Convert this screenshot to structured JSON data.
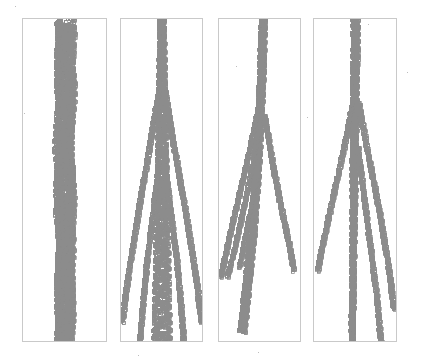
{
  "figure": {
    "type": "small-multiples",
    "panel_count": 4,
    "background_color": "#ffffff",
    "marker_color": "#8c8c8c",
    "marker_shape": "square-outline",
    "marker_size_px": 2.6,
    "panel_border_color": "#c9c9c9",
    "canvas_width": 427,
    "canvas_height": 362
  },
  "panels": [
    {
      "id": "panel-1",
      "label": "",
      "x": 22,
      "y": 18,
      "width": 85,
      "height": 324,
      "description": "single noisy vertical band, no branching"
    },
    {
      "id": "panel-2",
      "label": "",
      "x": 120,
      "y": 18,
      "width": 83,
      "height": 324,
      "description": "symmetric two-sided fan from central braid"
    },
    {
      "id": "panel-3",
      "label": "",
      "x": 218,
      "y": 18,
      "width": 83,
      "height": 324,
      "description": "asymmetric multi-branch fan, braid drifts left"
    },
    {
      "id": "panel-4",
      "label": "",
      "x": 313,
      "y": 18,
      "width": 84,
      "height": 324,
      "description": "branching with dominant rightward fan and straight central spine"
    }
  ],
  "chart_data": {
    "type": "scatter",
    "title": "",
    "subtitle": "",
    "xlabel": "",
    "ylabel": "",
    "grid": false,
    "legend": null,
    "axes_visible": false,
    "tick_labels_x": [],
    "tick_labels_y": [],
    "xlim": [
      0,
      1
    ],
    "ylim": [
      0,
      1
    ],
    "note": "Each panel plots marker trajectories in normalized panel coordinates; x in [0,1] left-to-right, y in [0,1] top-to-bottom. Branch entries give the polyline the markers follow plus the braid amplitude (half-width of the oscillating ribbon) at the start and end of each branch.",
    "panel_series": [
      {
        "panel": "panel-1",
        "branches": [
          {
            "name": "main-braid",
            "points": [
              [
                0.5,
                0.0
              ],
              [
                0.52,
                0.06
              ],
              [
                0.49,
                0.13
              ],
              [
                0.53,
                0.21
              ],
              [
                0.5,
                0.3
              ],
              [
                0.47,
                0.4
              ],
              [
                0.51,
                0.5
              ],
              [
                0.48,
                0.6
              ],
              [
                0.52,
                0.7
              ],
              [
                0.49,
                0.8
              ],
              [
                0.51,
                0.9
              ],
              [
                0.48,
                1.0
              ]
            ],
            "amp_start": 0.12,
            "amp_end": 0.1,
            "density": 2.1,
            "wavelength": 0.022
          },
          {
            "name": "inner-strand-a",
            "points": [
              [
                0.46,
                0.02
              ],
              [
                0.44,
                0.18
              ],
              [
                0.47,
                0.34
              ],
              [
                0.43,
                0.52
              ],
              [
                0.46,
                0.7
              ],
              [
                0.44,
                0.88
              ],
              [
                0.46,
                1.0
              ]
            ],
            "amp_start": 0.055,
            "amp_end": 0.05,
            "density": 1.6,
            "wavelength": 0.018
          },
          {
            "name": "inner-strand-b",
            "points": [
              [
                0.55,
                0.02
              ],
              [
                0.57,
                0.2
              ],
              [
                0.54,
                0.38
              ],
              [
                0.58,
                0.56
              ],
              [
                0.55,
                0.74
              ],
              [
                0.57,
                0.92
              ],
              [
                0.55,
                1.0
              ]
            ],
            "amp_start": 0.05,
            "amp_end": 0.045,
            "density": 1.6,
            "wavelength": 0.019
          }
        ]
      },
      {
        "panel": "panel-2",
        "branches": [
          {
            "name": "main-braid",
            "points": [
              [
                0.5,
                0.0
              ],
              [
                0.5,
                0.1
              ],
              [
                0.5,
                0.22
              ],
              [
                0.5,
                0.34
              ],
              [
                0.5,
                0.46
              ],
              [
                0.5,
                0.58
              ],
              [
                0.5,
                0.7
              ],
              [
                0.5,
                0.82
              ],
              [
                0.5,
                0.92
              ],
              [
                0.5,
                1.0
              ]
            ],
            "amp_start": 0.035,
            "amp_end": 0.11,
            "density": 2.3,
            "wavelength": 0.024
          },
          {
            "name": "fan-left-outer",
            "points": [
              [
                0.47,
                0.21
              ],
              [
                0.36,
                0.38
              ],
              [
                0.22,
                0.58
              ],
              [
                0.08,
                0.8
              ],
              [
                0.01,
                0.94
              ]
            ],
            "amp_start": 0.02,
            "amp_end": 0.02,
            "density": 1.5,
            "wavelength": 0.02
          },
          {
            "name": "fan-right-outer",
            "points": [
              [
                0.53,
                0.21
              ],
              [
                0.64,
                0.38
              ],
              [
                0.78,
                0.58
              ],
              [
                0.92,
                0.8
              ],
              [
                0.99,
                0.94
              ]
            ],
            "amp_start": 0.02,
            "amp_end": 0.02,
            "density": 1.5,
            "wavelength": 0.02
          },
          {
            "name": "fan-left-inner",
            "points": [
              [
                0.47,
                0.44
              ],
              [
                0.4,
                0.58
              ],
              [
                0.32,
                0.74
              ],
              [
                0.26,
                0.9
              ],
              [
                0.23,
                1.0
              ]
            ],
            "amp_start": 0.018,
            "amp_end": 0.018,
            "density": 1.4,
            "wavelength": 0.02
          },
          {
            "name": "fan-right-inner",
            "points": [
              [
                0.53,
                0.44
              ],
              [
                0.6,
                0.58
              ],
              [
                0.68,
                0.74
              ],
              [
                0.74,
                0.9
              ],
              [
                0.77,
                1.0
              ]
            ],
            "amp_start": 0.018,
            "amp_end": 0.018,
            "density": 1.4,
            "wavelength": 0.02
          }
        ]
      },
      {
        "panel": "panel-3",
        "branches": [
          {
            "name": "main-braid",
            "points": [
              [
                0.54,
                0.0
              ],
              [
                0.53,
                0.09
              ],
              [
                0.52,
                0.18
              ],
              [
                0.5,
                0.28
              ],
              [
                0.48,
                0.38
              ],
              [
                0.46,
                0.48
              ],
              [
                0.43,
                0.58
              ],
              [
                0.4,
                0.68
              ],
              [
                0.36,
                0.78
              ],
              [
                0.32,
                0.88
              ],
              [
                0.28,
                0.97
              ]
            ],
            "amp_start": 0.035,
            "amp_end": 0.045,
            "density": 2.2,
            "wavelength": 0.023
          },
          {
            "name": "branch-far-left",
            "points": [
              [
                0.49,
                0.27
              ],
              [
                0.38,
                0.4
              ],
              [
                0.24,
                0.55
              ],
              [
                0.1,
                0.7
              ],
              [
                0.02,
                0.8
              ]
            ],
            "amp_start": 0.02,
            "amp_end": 0.02,
            "density": 1.5,
            "wavelength": 0.02
          },
          {
            "name": "branch-mid-left",
            "points": [
              [
                0.48,
                0.36
              ],
              [
                0.4,
                0.47
              ],
              [
                0.29,
                0.6
              ],
              [
                0.18,
                0.72
              ],
              [
                0.1,
                0.8
              ]
            ],
            "amp_start": 0.018,
            "amp_end": 0.018,
            "density": 1.4,
            "wavelength": 0.02
          },
          {
            "name": "branch-right",
            "points": [
              [
                0.56,
                0.3
              ],
              [
                0.65,
                0.44
              ],
              [
                0.76,
                0.58
              ],
              [
                0.86,
                0.7
              ],
              [
                0.92,
                0.78
              ]
            ],
            "amp_start": 0.02,
            "amp_end": 0.02,
            "density": 1.5,
            "wavelength": 0.02
          },
          {
            "name": "branch-short-left",
            "points": [
              [
                0.46,
                0.5
              ],
              [
                0.38,
                0.6
              ],
              [
                0.3,
                0.7
              ],
              [
                0.25,
                0.77
              ]
            ],
            "amp_start": 0.016,
            "amp_end": 0.016,
            "density": 1.3,
            "wavelength": 0.02
          }
        ]
      },
      {
        "panel": "panel-4",
        "branches": [
          {
            "name": "main-braid",
            "points": [
              [
                0.5,
                0.0
              ],
              [
                0.5,
                0.1
              ],
              [
                0.49,
                0.2
              ],
              [
                0.49,
                0.32
              ],
              [
                0.48,
                0.45
              ],
              [
                0.48,
                0.58
              ],
              [
                0.47,
                0.7
              ],
              [
                0.47,
                0.82
              ],
              [
                0.46,
                0.92
              ],
              [
                0.46,
                1.0
              ]
            ],
            "amp_start": 0.04,
            "amp_end": 0.022,
            "density": 2.2,
            "wavelength": 0.023
          },
          {
            "name": "fan-left-outer",
            "points": [
              [
                0.47,
                0.26
              ],
              [
                0.36,
                0.4
              ],
              [
                0.22,
                0.56
              ],
              [
                0.1,
                0.7
              ],
              [
                0.04,
                0.78
              ]
            ],
            "amp_start": 0.02,
            "amp_end": 0.02,
            "density": 1.5,
            "wavelength": 0.02
          },
          {
            "name": "fan-right-outer",
            "points": [
              [
                0.54,
                0.26
              ],
              [
                0.64,
                0.4
              ],
              [
                0.78,
                0.58
              ],
              [
                0.9,
                0.76
              ],
              [
                0.97,
                0.9
              ]
            ],
            "amp_start": 0.02,
            "amp_end": 0.02,
            "density": 1.5,
            "wavelength": 0.02
          },
          {
            "name": "fan-right-inner",
            "points": [
              [
                0.53,
                0.4
              ],
              [
                0.6,
                0.54
              ],
              [
                0.68,
                0.7
              ],
              [
                0.76,
                0.86
              ],
              [
                0.81,
                1.0
              ]
            ],
            "amp_start": 0.018,
            "amp_end": 0.018,
            "density": 1.4,
            "wavelength": 0.02
          },
          {
            "name": "spine-lower",
            "points": [
              [
                0.48,
                0.5
              ],
              [
                0.47,
                0.64
              ],
              [
                0.47,
                0.78
              ],
              [
                0.46,
                0.9
              ],
              [
                0.46,
                1.0
              ]
            ],
            "amp_start": 0.016,
            "amp_end": 0.014,
            "density": 1.8,
            "wavelength": 0.021
          }
        ]
      }
    ],
    "stray_specks": [
      {
        "x": 15,
        "y": 6
      },
      {
        "x": 368,
        "y": 24
      },
      {
        "x": 407,
        "y": 72
      },
      {
        "x": 236,
        "y": 66
      },
      {
        "x": 24,
        "y": 113
      },
      {
        "x": 307,
        "y": 117
      },
      {
        "x": 55,
        "y": 196
      },
      {
        "x": 283,
        "y": 212
      },
      {
        "x": 258,
        "y": 352
      },
      {
        "x": 138,
        "y": 355
      }
    ]
  }
}
